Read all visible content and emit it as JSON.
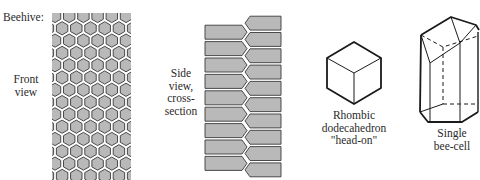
{
  "labels": {
    "beehive": "Beehive:",
    "front_view": [
      "Front",
      "view"
    ],
    "side_view": [
      "Side",
      "view,",
      "cross-",
      "section"
    ],
    "rhombic": [
      "Rhombic",
      "dodecahedron",
      "\"head-on\""
    ],
    "single_cell": [
      "Single",
      "bee-cell"
    ]
  },
  "colors": {
    "cell_fill": "#b9b9b9",
    "cell_stroke": "#3a3a3a",
    "wall_gap": "#ffffff",
    "line": "#1a1a1a"
  },
  "front_view": {
    "x": 52,
    "y": 13,
    "width": 79,
    "height": 167,
    "hex_radius": 8.2
  },
  "side_view": {
    "left_column": {
      "x": 205,
      "y": 24,
      "width": 43,
      "rows": 9,
      "row_height": 16.4
    },
    "right_column": {
      "x": 244,
      "y": 15,
      "width": 37,
      "rows": 10,
      "row_height": 16.3
    }
  }
}
